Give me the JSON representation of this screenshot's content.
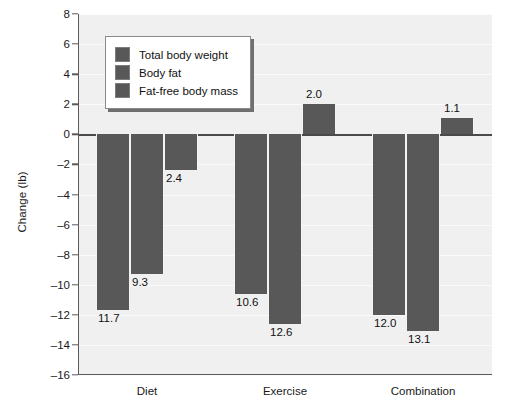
{
  "chart_data": {
    "type": "bar",
    "title": "",
    "xlabel": "",
    "ylabel": "Change (lb)",
    "ylim": [
      -16,
      8
    ],
    "ytick_step": 2,
    "yticks": [
      8,
      6,
      4,
      2,
      0,
      -2,
      -4,
      -6,
      -8,
      -10,
      -12,
      -14,
      -16
    ],
    "ytick_labels": [
      "8",
      "6",
      "4",
      "2",
      "0",
      "-2",
      "-4",
      "-6",
      "-8",
      "-10",
      "-12",
      "-14",
      "-16"
    ],
    "grid": true,
    "legend_position": "upper-left-inside",
    "categories": [
      "Diet",
      "Exercise",
      "Combination"
    ],
    "series": [
      {
        "name": "Total body weight",
        "color": "#585858",
        "values": [
          -11.7,
          -10.6,
          -12.0
        ],
        "labels": [
          "11.7",
          "10.6",
          "12.0"
        ]
      },
      {
        "name": "Body fat",
        "color": "#585858",
        "values": [
          -9.3,
          -12.6,
          -13.1
        ],
        "labels": [
          "9.3",
          "12.6",
          "13.1"
        ]
      },
      {
        "name": "Fat-free body mass",
        "color": "#585858",
        "values": [
          -2.4,
          2.0,
          1.1
        ],
        "labels": [
          "2.4",
          "2.0",
          "1.1"
        ]
      }
    ]
  },
  "colors": {
    "bar": "#585858",
    "plot_background": "#f0f0f0",
    "gridline": "#fbfbfb",
    "axis": "#5a5a5a",
    "text": "#1a1a1a",
    "legend_background": "#ffffff",
    "legend_border": "#8a8a8a",
    "legend_shadow": "#6f6f6f"
  }
}
